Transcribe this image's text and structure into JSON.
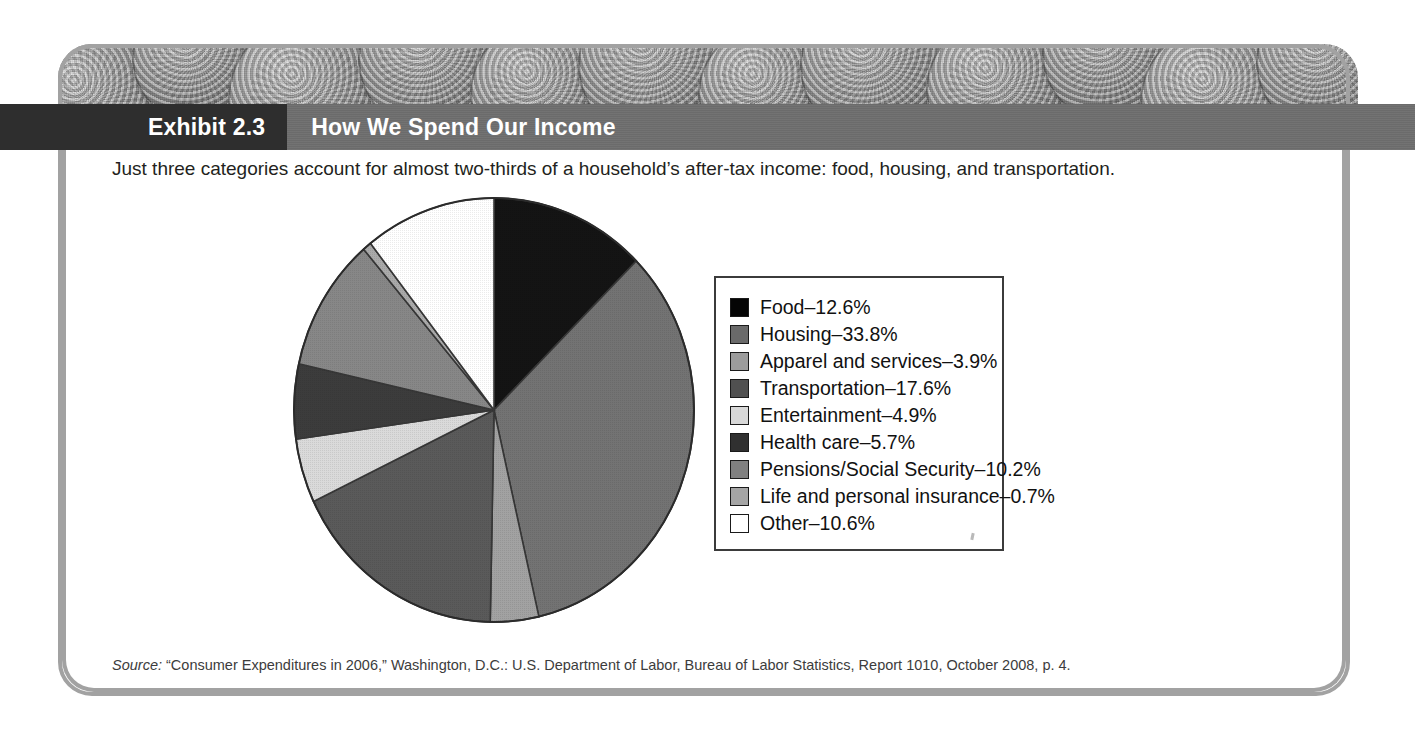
{
  "header": {
    "exhibit_label": "Exhibit 2.3",
    "title": "How We Spend Our Income",
    "bar_color": "#6e6e6e",
    "tag_color": "#2e2e2e"
  },
  "subtitle": "Just three categories account for almost two-thirds of a household’s after-tax income: food, housing, and transportation.",
  "source": {
    "prefix": "Source:",
    "text": " “Consumer Expenditures in 2006,” Washington, D.C.: U.S. Department of Labor, Bureau of Labor Statistics, Report 1010, October 2008, p. 4."
  },
  "chart_data": {
    "type": "pie",
    "title": "How We Spend Our Income",
    "subtitle": "Just three categories account for almost two-thirds of a household’s after-tax income: food, housing, and transportation.",
    "unit": "%",
    "start_angle_deg": 0,
    "direction": "clockwise",
    "legend_position": "right",
    "categories": [
      "Food",
      "Housing",
      "Apparel and services",
      "Transportation",
      "Entertainment",
      "Health care",
      "Pensions/Social Security",
      "Life and personal insurance",
      "Other"
    ],
    "values": [
      12.6,
      33.8,
      3.9,
      17.6,
      4.9,
      5.7,
      10.2,
      0.7,
      10.6
    ],
    "colors": [
      "#050505",
      "#6a6a6a",
      "#9c9c9c",
      "#505050",
      "#d8d8d8",
      "#303030",
      "#808080",
      "#a5a5a5",
      "#ffffff"
    ],
    "legend_entries": [
      {
        "label": "Food–12.6%",
        "color": "#050505"
      },
      {
        "label": "Housing–33.8%",
        "color": "#6a6a6a"
      },
      {
        "label": "Apparel and services–3.9%",
        "color": "#9c9c9c"
      },
      {
        "label": "Transportation–17.6%",
        "color": "#505050"
      },
      {
        "label": "Entertainment–4.9%",
        "color": "#d8d8d8"
      },
      {
        "label": "Health care–5.7%",
        "color": "#303030"
      },
      {
        "label": "Pensions/Social Security–10.2%",
        "color": "#808080"
      },
      {
        "label": "Life and personal insurance–0.7%",
        "color": "#a5a5a5"
      },
      {
        "label": "Other–10.6%",
        "color": "#ffffff"
      }
    ]
  }
}
